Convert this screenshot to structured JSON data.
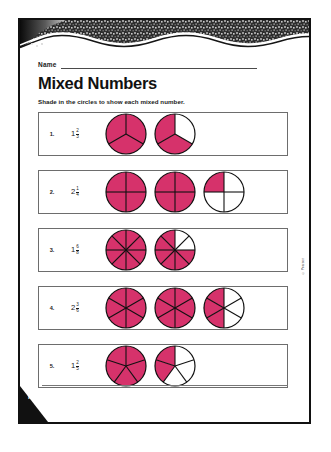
{
  "page": {
    "name_label": "Name",
    "title": "Mixed Numbers",
    "instruction": "Shade in the circles to show each mixed number.",
    "page_code": "P14",
    "side_credit": "© Pearson",
    "shade_color": "#D6326B",
    "outline_color": "#111111",
    "row_border_color": "#6d6d6d"
  },
  "problems": [
    {
      "number": "1.",
      "whole": "1",
      "numerator": "2",
      "denominator": "3",
      "denominator_value": 3,
      "circles": [
        {
          "sectors": 3,
          "shaded": 3,
          "diameter": 42
        },
        {
          "sectors": 3,
          "shaded": 2,
          "diameter": 42
        }
      ]
    },
    {
      "number": "2.",
      "whole": "2",
      "numerator": "1",
      "denominator": "4",
      "denominator_value": 4,
      "circles": [
        {
          "sectors": 4,
          "shaded": 4,
          "diameter": 42
        },
        {
          "sectors": 4,
          "shaded": 4,
          "diameter": 42
        },
        {
          "sectors": 4,
          "shaded": 1,
          "diameter": 42
        }
      ]
    },
    {
      "number": "3.",
      "whole": "1",
      "numerator": "6",
      "denominator": "8",
      "denominator_value": 8,
      "circles": [
        {
          "sectors": 8,
          "shaded": 8,
          "diameter": 42
        },
        {
          "sectors": 8,
          "shaded": 6,
          "diameter": 42
        }
      ]
    },
    {
      "number": "4.",
      "whole": "2",
      "numerator": "3",
      "denominator": "6",
      "denominator_value": 6,
      "circles": [
        {
          "sectors": 6,
          "shaded": 6,
          "diameter": 42
        },
        {
          "sectors": 6,
          "shaded": 6,
          "diameter": 42
        },
        {
          "sectors": 6,
          "shaded": 3,
          "diameter": 42
        }
      ]
    },
    {
      "number": "5.",
      "whole": "1",
      "numerator": "2",
      "denominator": "5",
      "denominator_value": 5,
      "circles": [
        {
          "sectors": 5,
          "shaded": 5,
          "diameter": 42
        },
        {
          "sectors": 5,
          "shaded": 2,
          "diameter": 42
        }
      ]
    }
  ]
}
